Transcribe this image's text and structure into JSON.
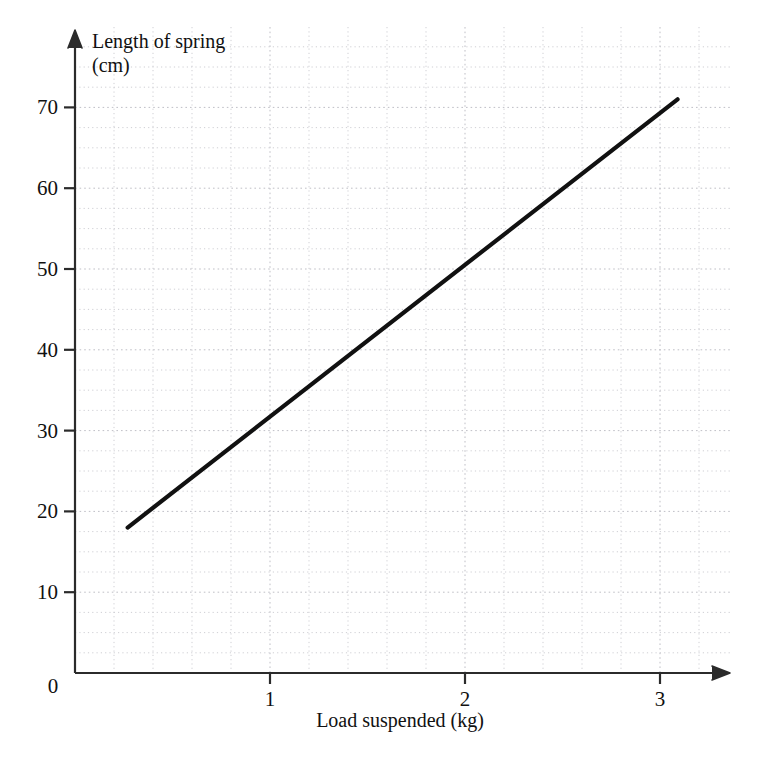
{
  "chart_data": {
    "type": "line",
    "title": "",
    "xlabel": "Load suspended (kg)",
    "ylabel_line1": "Length of spring",
    "ylabel_line2": "(cm)",
    "ylabel": "Length of spring (cm)",
    "xlim": [
      0,
      3.35
    ],
    "ylim": [
      0,
      77
    ],
    "xticks": [
      0,
      1,
      2,
      3
    ],
    "xtick_labels": [
      "0",
      "1",
      "2",
      "3"
    ],
    "yticks": [
      10,
      20,
      30,
      40,
      50,
      60,
      70
    ],
    "ytick_labels": [
      "10",
      "20",
      "30",
      "40",
      "50",
      "60",
      "70"
    ],
    "grid": true,
    "grid_minor_x_step": 0.2,
    "grid_minor_y_step": 2.5,
    "legend": null,
    "series": [
      {
        "name": "Length of spring vs load",
        "x": [
          0.27,
          3.09
        ],
        "values": [
          18.0,
          71.0
        ],
        "points": [
          [
            0.27,
            18.0
          ],
          [
            3.09,
            71.0
          ]
        ],
        "color": "#111111",
        "style": "solid",
        "width": 4.2
      }
    ],
    "annotations": []
  },
  "axes": {
    "x_axis_name": "x-axis",
    "y_axis_name": "y-axis",
    "x_arrow": "arrow-right",
    "y_arrow": "arrow-up"
  },
  "colors": {
    "line": "#111111",
    "axis": "#2b2b2b",
    "grid": "#c9c9cf",
    "background": "#ffffff",
    "text": "#111111"
  }
}
